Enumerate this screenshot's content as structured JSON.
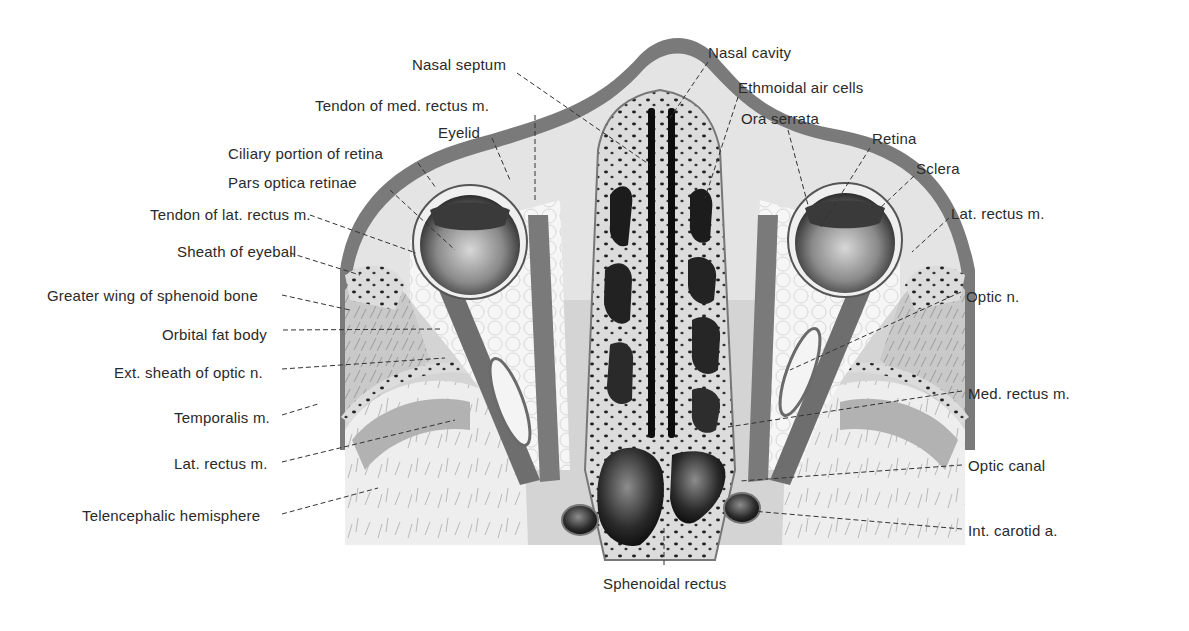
{
  "figure": {
    "colors": {
      "skin": "#7a7a7a",
      "subcutis": "#e6e6e6",
      "bone": "#d9d9d9",
      "muscle": "#6e6e6e",
      "fat": "#f4f4f4",
      "cavity": "#111111",
      "brain_gray": "#b4b4b4",
      "brain_white": "#ededed",
      "label_text": "#2a2a2a",
      "leader": "#333333"
    }
  },
  "labels_left": [
    {
      "id": "tendon-med-rectus",
      "text": "Tendon of med. rectus m.",
      "x": 315,
      "y": 97,
      "align": "left",
      "lx1": 535,
      "ly1": 115,
      "lx2": 535,
      "ly2": 200
    },
    {
      "id": "eyelid",
      "text": "Eyelid",
      "x": 438,
      "y": 124,
      "align": "left",
      "lx1": 492,
      "ly1": 138,
      "lx2": 510,
      "ly2": 180
    },
    {
      "id": "ciliary-portion",
      "text": "Ciliary portion of retina",
      "x": 228,
      "y": 145,
      "align": "left",
      "lx1": 418,
      "ly1": 163,
      "lx2": 436,
      "ly2": 188
    },
    {
      "id": "pars-optica",
      "text": "Pars optica retinae",
      "x": 228,
      "y": 174,
      "align": "left",
      "lx1": 390,
      "ly1": 190,
      "lx2": 455,
      "ly2": 250
    },
    {
      "id": "tendon-lat-rectus",
      "text": "Tendon of lat. rectus m.",
      "x": 150,
      "y": 206,
      "align": "left",
      "lx1": 310,
      "ly1": 215,
      "lx2": 416,
      "ly2": 253
    },
    {
      "id": "sheath-eyeball",
      "text": "Sheath of eyeball",
      "x": 177,
      "y": 243,
      "align": "left",
      "lx1": 290,
      "ly1": 253,
      "lx2": 360,
      "ly2": 275
    },
    {
      "id": "greater-wing",
      "text": "Greater wing of sphenoid bone",
      "x": 47,
      "y": 287,
      "align": "left",
      "lx1": 282,
      "ly1": 295,
      "lx2": 350,
      "ly2": 310
    },
    {
      "id": "orbital-fat",
      "text": "Orbital fat body",
      "x": 162,
      "y": 326,
      "align": "left",
      "lx1": 283,
      "ly1": 330,
      "lx2": 440,
      "ly2": 329
    },
    {
      "id": "ext-sheath-optic",
      "text": "Ext. sheath of optic n.",
      "x": 114,
      "y": 364,
      "align": "left",
      "lx1": 282,
      "ly1": 369,
      "lx2": 445,
      "ly2": 358
    },
    {
      "id": "temporalis",
      "text": "Temporalis m.",
      "x": 174,
      "y": 409,
      "align": "left",
      "lx1": 282,
      "ly1": 415,
      "lx2": 318,
      "ly2": 404
    },
    {
      "id": "lat-rectus-left",
      "text": "Lat. rectus m.",
      "x": 174,
      "y": 455,
      "align": "left",
      "lx1": 282,
      "ly1": 462,
      "lx2": 455,
      "ly2": 420
    },
    {
      "id": "telencephalic",
      "text": "Telencephalic hemisphere",
      "x": 82,
      "y": 507,
      "align": "left",
      "lx1": 282,
      "ly1": 514,
      "lx2": 378,
      "ly2": 488
    }
  ],
  "labels_top": [
    {
      "id": "nasal-septum",
      "text": "Nasal septum",
      "x": 412,
      "y": 56,
      "align": "left",
      "lx1": 517,
      "ly1": 73,
      "lx2": 650,
      "ly2": 165
    },
    {
      "id": "nasal-cavity",
      "text": "Nasal cavity",
      "x": 708,
      "y": 44,
      "align": "left",
      "lx1": 708,
      "ly1": 62,
      "lx2": 670,
      "ly2": 118
    },
    {
      "id": "ethmoidal",
      "text": "Ethmoidal air cells",
      "x": 738,
      "y": 79,
      "align": "left",
      "lx1": 738,
      "ly1": 97,
      "lx2": 705,
      "ly2": 198
    },
    {
      "id": "ora-serrata",
      "text": "Ora serrata",
      "x": 741,
      "y": 110,
      "align": "left",
      "lx1": 788,
      "ly1": 130,
      "lx2": 808,
      "ly2": 205
    },
    {
      "id": "retina",
      "text": "Retina",
      "x": 872,
      "y": 130,
      "align": "left",
      "lx1": 870,
      "ly1": 148,
      "lx2": 820,
      "ly2": 228
    },
    {
      "id": "sclera",
      "text": "Sclera",
      "x": 916,
      "y": 160,
      "align": "left",
      "lx1": 914,
      "ly1": 176,
      "lx2": 878,
      "ly2": 210
    }
  ],
  "labels_right": [
    {
      "id": "lat-rectus-right",
      "text": "Lat. rectus m.",
      "x": 951,
      "y": 205,
      "align": "left",
      "lx1": 949,
      "ly1": 218,
      "lx2": 912,
      "ly2": 252
    },
    {
      "id": "optic-n",
      "text": "Optic n.",
      "x": 966,
      "y": 288,
      "align": "left",
      "lx1": 961,
      "ly1": 292,
      "lx2": 790,
      "ly2": 370
    },
    {
      "id": "med-rectus",
      "text": "Med. rectus m.",
      "x": 968,
      "y": 385,
      "align": "left",
      "lx1": 962,
      "ly1": 391,
      "lx2": 728,
      "ly2": 427
    },
    {
      "id": "optic-canal",
      "text": "Optic canal",
      "x": 968,
      "y": 457,
      "align": "left",
      "lx1": 962,
      "ly1": 465,
      "lx2": 740,
      "ly2": 481
    },
    {
      "id": "int-carotid",
      "text": "Int. carotid a.",
      "x": 968,
      "y": 522,
      "align": "left",
      "lx1": 962,
      "ly1": 529,
      "lx2": 752,
      "ly2": 511
    }
  ],
  "labels_bottom": [
    {
      "id": "sphenoidal",
      "text": "Sphenoidal rectus",
      "x": 603,
      "y": 575,
      "align": "left",
      "lx1": 664,
      "ly1": 528,
      "lx2": 664,
      "ly2": 567
    }
  ]
}
